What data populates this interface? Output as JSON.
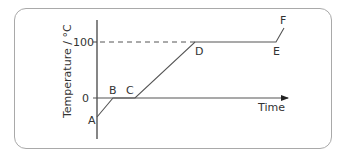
{
  "diagram": {
    "y_axis_label": "Temperature / °C",
    "x_axis_label": "Time",
    "y_ticks": [
      "100",
      "0"
    ],
    "points": [
      {
        "label": "A"
      },
      {
        "label": "B"
      },
      {
        "label": "C"
      },
      {
        "label": "D"
      },
      {
        "label": "E"
      },
      {
        "label": "F"
      }
    ],
    "colors": {
      "line": "#555555",
      "frame": "#a9a9a9",
      "text": "#333333"
    }
  }
}
